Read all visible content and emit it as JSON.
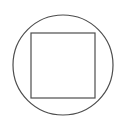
{
  "canvas": {
    "width": 115,
    "height": 120,
    "background_color": "#ffffff"
  },
  "figure": {
    "name": "square-inscribed-in-circle",
    "stroke_color": "#4d4d4d",
    "fill": "none"
  },
  "chart_data": {
    "type": "diagram",
    "title": "",
    "xlabel": "",
    "ylabel": "",
    "shapes": [
      {
        "name": "circle",
        "kind": "circle",
        "center_x": 63,
        "center_y": 65,
        "radius": 50,
        "stroke_color": "#4d4d4d",
        "stroke_width": 1.2,
        "fill": "none"
      },
      {
        "name": "square",
        "kind": "rect",
        "x": 31,
        "y": 33,
        "width": 64,
        "height": 65,
        "stroke_color": "#4d4d4d",
        "stroke_width": 1.2,
        "fill": "none"
      }
    ],
    "annotations": [],
    "legend": []
  }
}
